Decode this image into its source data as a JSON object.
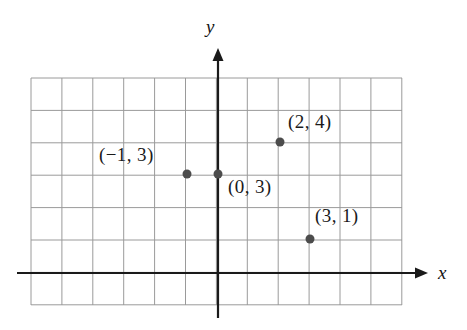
{
  "figure": {
    "title": "",
    "background_color": "#ffffff",
    "width": 467,
    "height": 330
  },
  "axes": {
    "x_axis": {
      "label": "x",
      "label_x": 438,
      "label_y": 262,
      "y_pixel": 273,
      "x_start_pixel": 17,
      "x_end_pixel": 428,
      "color": "#1a1a1a",
      "arrow": "right-arrow"
    },
    "y_axis": {
      "label": "y",
      "label_x": 206,
      "label_y": 16,
      "x_pixel": 218,
      "y_start_pixel": 48,
      "y_end_pixel": 318,
      "color": "#1a1a1a",
      "arrow": "up-arrow"
    }
  },
  "grid": {
    "color": "#9a9a9a",
    "left": 31,
    "top": 78,
    "right": 402,
    "bottom": 305,
    "columns": 12,
    "rows": 7,
    "cell_width": 30.9,
    "cell_height": 32.4,
    "origin_col_index": 6,
    "origin_row_index": 6
  },
  "chart_data": {
    "type": "scatter",
    "title": "",
    "xlabel": "x",
    "ylabel": "y",
    "grid": true,
    "legend": "none",
    "xlim": [
      -6,
      6
    ],
    "ylim": [
      -1,
      6
    ],
    "point_color": "#4c4c4c",
    "point_radius": 4.5,
    "points": [
      {
        "x": -1,
        "y": 3,
        "label": "(−1, 3)",
        "px": 187,
        "py": 174,
        "label_x": 99,
        "label_y": 144
      },
      {
        "x": 0,
        "y": 3,
        "label": "(0, 3)",
        "px": 218,
        "py": 174,
        "label_x": 228,
        "label_y": 176
      },
      {
        "x": 2,
        "y": 4,
        "label": "(2, 4)",
        "px": 280,
        "py": 142,
        "label_x": 288,
        "label_y": 111
      },
      {
        "x": 3,
        "y": 1,
        "label": "(3, 1)",
        "px": 310,
        "py": 239,
        "label_x": 315,
        "label_y": 205
      }
    ]
  }
}
